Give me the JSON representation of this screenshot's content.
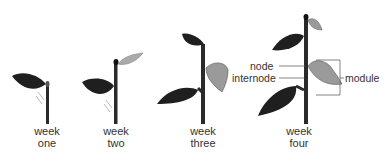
{
  "figure": {
    "plants": [
      {
        "week_label": "week",
        "number_label": "one"
      },
      {
        "week_label": "week",
        "number_label": "two"
      },
      {
        "week_label": "week",
        "number_label": "three"
      },
      {
        "week_label": "week",
        "number_label": "four"
      }
    ],
    "annotations": {
      "node": "node",
      "internode": "internode",
      "module": "module"
    },
    "colors": {
      "dark_leaf": "#1f1f1f",
      "light_leaf": "#9a9a9a",
      "stem": "#2a2a2a",
      "text": "#333333",
      "leader_line": "#666666"
    }
  }
}
